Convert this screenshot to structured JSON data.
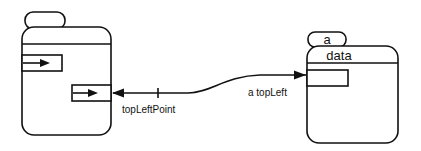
{
  "diagram": {
    "left_object": {
      "tab_label": "",
      "header_label": "",
      "slots": [
        {
          "name": "slot-1",
          "has_arrow": true
        },
        {
          "name": "slot-2",
          "has_arrow": true
        }
      ]
    },
    "right_object": {
      "tab_label": "a",
      "header_label": "data",
      "slots": [
        {
          "name": "slot-1",
          "has_arrow": false
        }
      ]
    },
    "connection": {
      "source_label": "topLeftPoint",
      "target_label": "a topLeft",
      "bidirectional": true
    },
    "colors": {
      "ink": "#111111",
      "background": "#ffffff"
    }
  }
}
